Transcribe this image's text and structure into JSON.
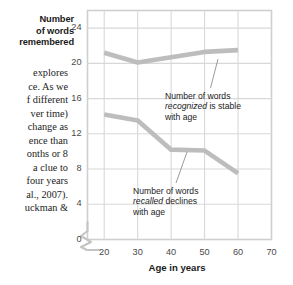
{
  "page": {
    "body_text_lines": [
      "explores",
      "ce. As we",
      "f different",
      "ver time)",
      "change as",
      "ence than",
      "onths or 8",
      "a clue to",
      "four years",
      "al., 2007).",
      "uckman &"
    ]
  },
  "chart_data": {
    "type": "line",
    "title": "",
    "xlabel": "Age in years",
    "ylabel": "Number of words remembered",
    "ylabel_lines": [
      "Number",
      "of words",
      "remembered"
    ],
    "xlim": [
      15,
      70
    ],
    "ylim": [
      0,
      26
    ],
    "xticks": [
      20,
      30,
      40,
      50,
      60,
      70
    ],
    "yticks": [
      0,
      4,
      8,
      12,
      16,
      20,
      24
    ],
    "xticklabels": [
      "20",
      "30",
      "40",
      "50",
      "60",
      "70"
    ],
    "yticklabels": [
      "0",
      "4",
      "8",
      "12",
      "16",
      "20",
      "24"
    ],
    "grid": true,
    "axis_break": true,
    "legend": "none",
    "x": [
      20,
      30,
      40,
      50,
      60
    ],
    "series": [
      {
        "name": "Number of words recognized",
        "values": [
          21.2,
          20.1,
          20.7,
          21.3,
          21.5
        ],
        "color": "#bdbdbd"
      },
      {
        "name": "Number of words recalled",
        "values": [
          14.2,
          13.5,
          10.2,
          10.1,
          7.5
        ],
        "color": "#bdbdbd"
      }
    ],
    "annotations": [
      {
        "id": "recognized",
        "lines": [
          "Number of words",
          "recognized is stable",
          "with age"
        ],
        "emphasis": "recognized",
        "line1_plain": "Number of words",
        "line2_italic": "recognized",
        "line2_rest": " is stable",
        "line3_plain": "with age"
      },
      {
        "id": "recalled",
        "lines": [
          "Number of words",
          "recalled declines",
          "with age"
        ],
        "emphasis": "recalled",
        "line1_plain": "Number of words",
        "line2_italic": "recalled",
        "line2_rest": " declines",
        "line3_plain": "with age"
      }
    ],
    "colors": {
      "grid": "#d8d8d8",
      "border": "#cfcfcf",
      "line": "#bdbdbd",
      "tick_text": "#4a4a4a",
      "title_text": "#1b1b1b"
    }
  }
}
